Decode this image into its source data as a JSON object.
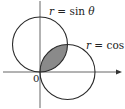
{
  "figure": {
    "labels": {
      "sin_curve": {
        "var": "r",
        "eq": " = sin ",
        "theta": "θ"
      },
      "cos_curve": {
        "var": "r",
        "eq": " = cos ",
        "theta": "θ"
      },
      "origin": "0"
    },
    "colors": {
      "stroke": "#2a2a2a",
      "axis": "#555555",
      "shaded_region": "#8a8a8a"
    }
  }
}
